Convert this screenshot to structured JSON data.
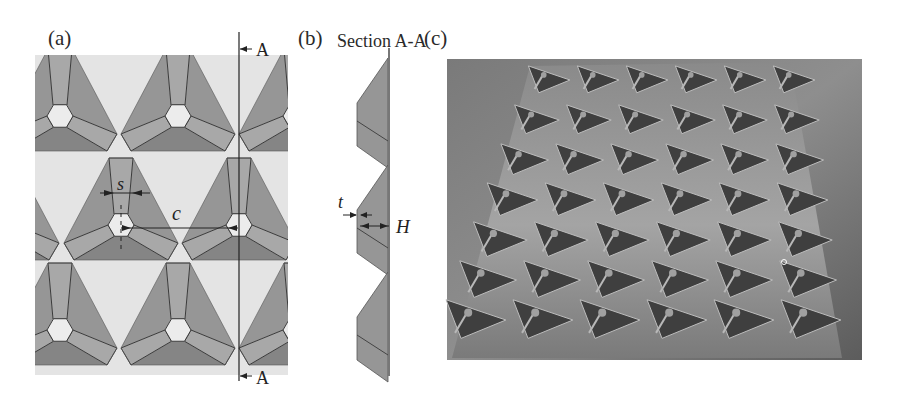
{
  "figure": {
    "panels": [
      {
        "id": "a",
        "label": "(a)",
        "description": "Plan view of tessellated triangular-pyramid unit cells"
      },
      {
        "id": "b",
        "label": "(b)",
        "title": "Section A-A",
        "description": "Cross-section profile along A-A"
      },
      {
        "id": "c",
        "label": "(c)",
        "description": "Photograph of fabricated panel with triangular dimple array"
      }
    ],
    "section_marker": "A",
    "dimensions": {
      "strut_width": "s",
      "cell_spacing": "c",
      "thickness": "t",
      "height": "H"
    },
    "colors": {
      "background_panel": "#e4e4e4",
      "face_light": "#a8a8a8",
      "face_mid": "#969696",
      "face_dark": "#858585",
      "edge": "#3a3a3a",
      "photo_bg": "#6c6c6c"
    }
  }
}
